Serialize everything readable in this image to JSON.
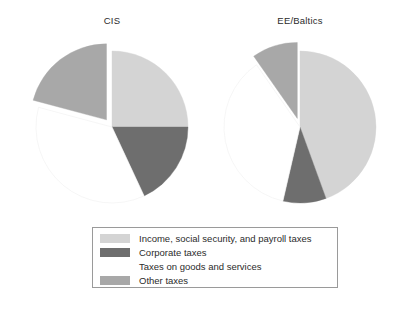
{
  "figure": {
    "background_color": "#ffffff",
    "width": 412,
    "height": 310
  },
  "panels": [
    {
      "title": "CIS"
    },
    {
      "title": "EE/Baltics"
    }
  ],
  "legend": {
    "border_color": "#9a9a9a",
    "entries": [
      {
        "label": "Income, social security, and payroll taxes",
        "color": "#d4d4d4"
      },
      {
        "label": "Corporate taxes",
        "color": "#6e6e6e"
      },
      {
        "label": "Taxes on goods and services",
        "color": "#ffffff"
      },
      {
        "label": "Other taxes",
        "color": "#a8a8a8"
      }
    ]
  },
  "chart_data": {
    "type": "pie",
    "title": "",
    "subtitle": "",
    "xlabel": "",
    "ylabel": "",
    "grid": false,
    "legend_position": "bottom-center",
    "categories": [
      "Income, social security, and payroll taxes",
      "Corporate taxes",
      "Taxes on goods and services",
      "Other taxes"
    ],
    "colors": [
      "#d4d4d4",
      "#6e6e6e",
      "#ffffff",
      "#a8a8a8"
    ],
    "start_angle_deg": 0,
    "direction": "clockwise",
    "charts": [
      {
        "title": "CIS",
        "center": [
          112,
          127
        ],
        "radius": 76,
        "values": [
          25,
          18,
          36,
          21
        ],
        "angles_deg": [
          90,
          65,
          130,
          75
        ],
        "exploded": [
          false,
          false,
          false,
          true
        ],
        "explode_offset_px": 9
      },
      {
        "title": "EE/Baltics",
        "center": [
          300,
          127
        ],
        "radius": 76,
        "values": [
          44,
          9,
          37,
          10
        ],
        "angles_deg": [
          160,
          33,
          132,
          35
        ],
        "exploded": [
          false,
          false,
          false,
          true
        ],
        "explode_offset_px": 9
      }
    ]
  }
}
